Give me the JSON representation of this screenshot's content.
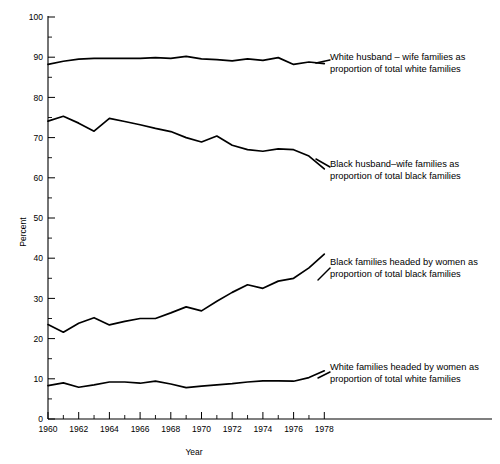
{
  "chart_data": {
    "type": "line",
    "title": "",
    "xlabel": "Year",
    "ylabel": "Percent",
    "xlim": [
      1960,
      1980
    ],
    "ylim": [
      0,
      100
    ],
    "grid": false,
    "legend_position": "inline-annotations",
    "x": [
      1960,
      1961,
      1962,
      1963,
      1964,
      1965,
      1966,
      1967,
      1968,
      1969,
      1970,
      1971,
      1972,
      1973,
      1974,
      1975,
      1976,
      1977,
      1978
    ],
    "x_tick_labels": [
      "1960",
      "1962",
      "1964",
      "1966",
      "1968",
      "1970",
      "1972",
      "1974",
      "1976",
      "1978"
    ],
    "x_tick_values": [
      1960,
      1962,
      1964,
      1966,
      1968,
      1970,
      1972,
      1974,
      1976,
      1978
    ],
    "x_minor_tick_values": [
      1961,
      1963,
      1965,
      1967,
      1969,
      1971,
      1973,
      1975,
      1977
    ],
    "y_tick_labels": [
      "0",
      "10",
      "20",
      "30",
      "40",
      "50",
      "60",
      "70",
      "80",
      "90",
      "100"
    ],
    "y_tick_values": [
      0,
      10,
      20,
      30,
      40,
      50,
      60,
      70,
      80,
      90,
      100
    ],
    "y_minor_tick_values": [
      5,
      15,
      25,
      35,
      45,
      55,
      65,
      75,
      85,
      95
    ],
    "series": [
      {
        "name": "White husband – wife families as proportion of total white families",
        "label_line1": "White husband – wife families as",
        "label_line2": "proportion of total white families",
        "color": "#000000",
        "values": [
          88.2,
          89.0,
          89.5,
          89.7,
          89.7,
          89.7,
          89.7,
          89.9,
          89.7,
          90.2,
          89.6,
          89.4,
          89.1,
          89.6,
          89.2,
          89.9,
          88.2,
          88.8,
          88.4
        ]
      },
      {
        "name": "Black husband – wife families as proportion of total black families",
        "label_line1": "Black husband–wife families as",
        "label_line2": "proportion of total black families",
        "color": "#000000",
        "values": [
          74.1,
          75.3,
          73.6,
          71.6,
          74.8,
          74.0,
          73.2,
          72.3,
          71.5,
          70.0,
          68.9,
          70.4,
          68.1,
          67.0,
          66.6,
          67.2,
          67.0,
          65.4,
          62.2
        ]
      },
      {
        "name": "Black families headed by women as proportion of total black families",
        "label_line1": "Black families headed by women as",
        "label_line2": "proportion of total black families",
        "color": "#000000",
        "values": [
          23.5,
          21.6,
          23.8,
          25.2,
          23.4,
          24.3,
          25.0,
          25.0,
          26.4,
          27.9,
          26.9,
          29.3,
          31.5,
          33.4,
          32.5,
          34.3,
          35.0,
          37.6,
          41.0
        ]
      },
      {
        "name": "White families headed by women as proportion of total white families",
        "label_line1": "White families headed by women as",
        "label_line2": "proportion of total white families",
        "color": "#000000",
        "values": [
          8.3,
          9.0,
          7.9,
          8.5,
          9.2,
          9.2,
          8.9,
          9.4,
          8.7,
          7.8,
          8.2,
          8.5,
          8.8,
          9.2,
          9.5,
          9.5,
          9.4,
          10.3,
          12.0
        ]
      }
    ],
    "annotations": [
      {
        "id": "white-husband-wife",
        "text_x": 330,
        "text_y": 60,
        "leader": "M316,63 L330,60"
      },
      {
        "id": "black-husband-wife",
        "text_x": 330,
        "text_y": 167,
        "leader": "M316,159 L330,167"
      },
      {
        "id": "black-women",
        "text_x": 330,
        "text_y": 265,
        "leader": "M318,280 L330,268"
      },
      {
        "id": "white-women",
        "text_x": 330,
        "text_y": 370,
        "leader": "M318,378 L330,372"
      }
    ]
  }
}
